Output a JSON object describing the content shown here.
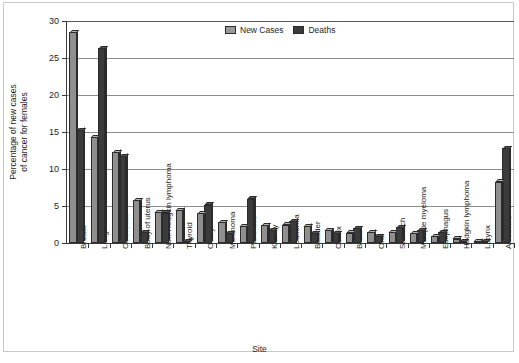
{
  "chart_data": {
    "type": "bar",
    "title": "",
    "xlabel": "Site",
    "ylabel": "Percentage of new cases of cancer for females",
    "ylabel_line1": "Percentage of new cases",
    "ylabel_line2": "of cancer for females",
    "ylim": [
      0,
      30
    ],
    "yticks": [
      0,
      5,
      10,
      15,
      20,
      25,
      30
    ],
    "ytick_labels": [
      "0",
      "5",
      "10",
      "15",
      "20",
      "25",
      "30"
    ],
    "grid": "horizontal",
    "legend_position": "top-center",
    "categories": [
      "Breast",
      "Lung",
      "Colorectal",
      "Body of uterus",
      "Non-Hodgkin lymphoma",
      "Thyroid",
      "Ovary",
      "Melanoma",
      "Pancreas",
      "Kidney",
      "Leukemia",
      "Bladder",
      "Cervix",
      "Brain",
      "Oral",
      "Stomach",
      "Multiple myeloma",
      "Esophagus",
      "Hodgkin lymphoma",
      "Larynx",
      "All others"
    ],
    "series": [
      {
        "name": "New Cases",
        "color": "#8f8f8f",
        "values": [
          28.5,
          14.3,
          12.3,
          5.8,
          4.2,
          4.5,
          4.0,
          2.8,
          2.3,
          2.4,
          2.5,
          2.3,
          1.7,
          1.4,
          1.5,
          1.5,
          1.3,
          0.9,
          0.6,
          0.3,
          8.3
        ]
      },
      {
        "name": "Deaths",
        "color": "#3b3b3b",
        "values": [
          15.3,
          26.3,
          11.8,
          1.5,
          4.1,
          0.3,
          5.2,
          1.3,
          6.0,
          1.7,
          3.0,
          1.3,
          1.3,
          2.0,
          0.9,
          2.2,
          1.8,
          1.5,
          0.3,
          0.3,
          12.8
        ]
      }
    ]
  },
  "legend": {
    "items": [
      {
        "label": "New Cases",
        "swatch": "new"
      },
      {
        "label": "Deaths",
        "swatch": "deaths"
      }
    ]
  }
}
